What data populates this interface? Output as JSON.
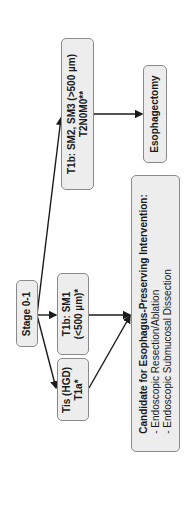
{
  "diagram": {
    "nodes": {
      "stage": {
        "label": "Stage 0-1"
      },
      "t1b_sm1": {
        "line1": "T1b: SM1",
        "line2": "(<500 µm)*"
      },
      "tis": {
        "line1": "Tis (HGD)",
        "line2": "T1a*"
      },
      "t1b_sm2": {
        "line1": "T1b: SM2, SM3 (>500 µm)",
        "line2": "T2N0M0**"
      },
      "esophagectomy": {
        "label": "Esophagectomy"
      },
      "candidate": {
        "title": "Candidate for Esophagus-Preserving Intervention:",
        "items": [
          "- Endoscopic Resection/Ablation",
          "- Endoscopic Submucosal Dissection"
        ]
      }
    },
    "colors": {
      "box_fill": "#ededed",
      "box_border": "#8a8a8a",
      "line": "#1a1a1a"
    }
  }
}
